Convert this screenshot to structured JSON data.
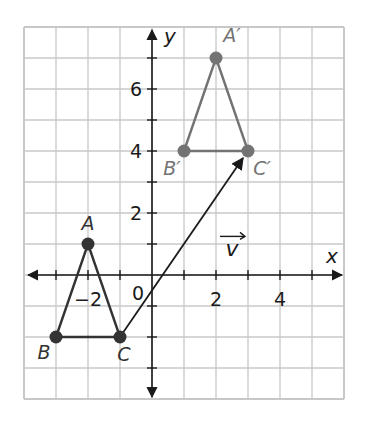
{
  "figure": {
    "type": "coordinate-plane-translation",
    "x_range": [
      -4,
      6
    ],
    "y_range": [
      -4,
      8
    ],
    "grid_step": 1,
    "axis_labels": {
      "x": "x",
      "y": "y"
    },
    "x_tick_labels": [
      {
        "value": -2,
        "text": "−2"
      },
      {
        "value": 2,
        "text": "2"
      },
      {
        "value": 4,
        "text": "4"
      }
    ],
    "y_tick_labels": [
      {
        "value": 2,
        "text": "2"
      },
      {
        "value": 4,
        "text": "4"
      },
      {
        "value": 6,
        "text": "6"
      }
    ],
    "origin_label": "0",
    "colors": {
      "grid": "#c8c8c8",
      "axis": "#1a1a1a",
      "preimage": "#333333",
      "image": "#737373",
      "vector": "#1a1a1a"
    },
    "preimage": {
      "name": "ABC",
      "points": [
        {
          "label": "A",
          "x": -2,
          "y": 1,
          "label_dx": 0,
          "label_dy": -14
        },
        {
          "label": "B",
          "x": -3,
          "y": -2,
          "label_dx": -12,
          "label_dy": 22
        },
        {
          "label": "C",
          "x": -1,
          "y": -2,
          "label_dx": 4,
          "label_dy": 24
        }
      ]
    },
    "image": {
      "name": "A'B'C'",
      "points": [
        {
          "label": "A′",
          "x": 2,
          "y": 7,
          "label_dx": 16,
          "label_dy": -16
        },
        {
          "label": "B′",
          "x": 1,
          "y": 4,
          "label_dx": -12,
          "label_dy": 24
        },
        {
          "label": "C′",
          "x": 3,
          "y": 4,
          "label_dx": 14,
          "label_dy": 24
        }
      ]
    },
    "vector": {
      "label": "v",
      "from": {
        "x": -1,
        "y": -2
      },
      "to": {
        "x": 3,
        "y": 4
      },
      "label_pos": {
        "x": 2.5,
        "y": 0.6
      }
    }
  }
}
